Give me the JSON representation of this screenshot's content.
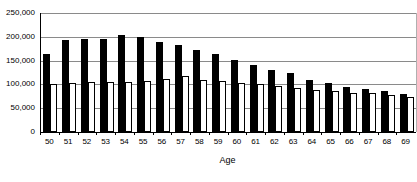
{
  "chart_data": {
    "type": "bar",
    "title": "",
    "subtitle": "",
    "xlabel": "Age",
    "ylabel": "",
    "categories": [
      "50",
      "51",
      "52",
      "53",
      "54",
      "55",
      "56",
      "57",
      "58",
      "59",
      "60",
      "61",
      "62",
      "63",
      "64",
      "65",
      "66",
      "67",
      "68",
      "69"
    ],
    "series": [
      {
        "name": "black-series",
        "color": "#000000",
        "values": [
          163000,
          193000,
          195000,
          195000,
          203000,
          200000,
          190000,
          182000,
          173000,
          163000,
          152000,
          140000,
          131000,
          124000,
          110000,
          103000,
          95000,
          90000,
          86000,
          80000
        ]
      },
      {
        "name": "white-series",
        "color": "#ffffff",
        "values": [
          100000,
          102000,
          105000,
          105000,
          106000,
          107000,
          112000,
          117000,
          110000,
          107000,
          104000,
          100000,
          96000,
          92000,
          88000,
          86000,
          83000,
          81000,
          78000,
          74000
        ]
      }
    ],
    "ylim": [
      0,
      250000
    ],
    "ytick_values": [
      0,
      50000,
      100000,
      150000,
      200000,
      250000
    ],
    "ytick_labels": [
      "0",
      "50,000",
      "100,000",
      "150,000",
      "200,000",
      "250,000"
    ],
    "grid": true,
    "grid_axis": "y",
    "legend": false,
    "legend_position": "none",
    "axis_color": "#000000",
    "grid_color": "#8a8a8a",
    "background": "#ffffff"
  }
}
